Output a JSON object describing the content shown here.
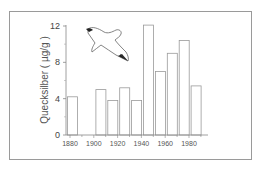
{
  "chart_data": {
    "type": "bar",
    "title": "",
    "xlabel": "",
    "ylabel": "Quecksilber ( µg/g )",
    "x": [
      1882,
      1906,
      1916,
      1926,
      1936,
      1946,
      1956,
      1966,
      1976,
      1986
    ],
    "values": [
      4.2,
      5.0,
      3.8,
      5.2,
      3.8,
      12.1,
      7.0,
      9.0,
      10.4,
      5.4
    ],
    "ylim": [
      0,
      12
    ],
    "xlim": [
      1878,
      1992
    ],
    "yticks": [
      0,
      4,
      8,
      12
    ],
    "yticks_minor": [
      2,
      6,
      10
    ],
    "xticks": [
      1880,
      1900,
      1920,
      1940,
      1960,
      1980
    ],
    "xtick_labels": [
      "1880",
      "1900",
      "1920",
      "1940",
      "1960",
      "1980"
    ],
    "ytick_labels": [
      "0",
      "4",
      "8",
      "12"
    ],
    "grid": false,
    "legend": null,
    "bar_style": "outlined",
    "bar_edge_color": "#9a9a9a",
    "bar_fill_color": "#ffffff",
    "annotation": "gull-illustration"
  },
  "ylabel": "Quecksilber ( µg/g )"
}
